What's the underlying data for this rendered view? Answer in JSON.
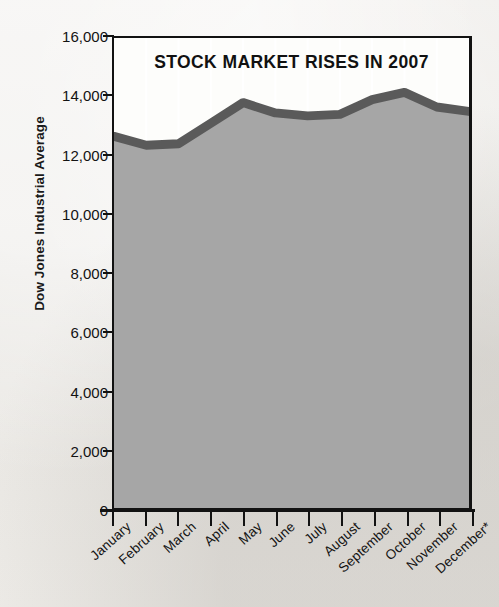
{
  "chart_data": {
    "type": "area",
    "title": "STOCK MARKET RISES IN 2007",
    "xlabel": "",
    "ylabel": "Dow Jones Industrial Average",
    "categories": [
      "January",
      "February",
      "March",
      "April",
      "May",
      "June",
      "July",
      "August",
      "September",
      "October",
      "November",
      "December*"
    ],
    "values": [
      12650,
      12350,
      12400,
      13100,
      13800,
      13450,
      13350,
      13400,
      13900,
      14150,
      13650,
      13500
    ],
    "ylim": [
      0,
      16000
    ],
    "ytick_values": [
      0,
      2000,
      4000,
      6000,
      8000,
      10000,
      12000,
      14000,
      16000
    ],
    "ytick_labels": [
      "0",
      "2,000",
      "4,000",
      "6,000",
      "8,000",
      "10,000",
      "12,000",
      "14,000",
      "16,000"
    ],
    "grid": true,
    "grid_color": "#ffffff",
    "legend": "none",
    "series_name": "Dow Jones Industrial Average",
    "area_fill_color": "#a6a6a6",
    "line_color": "#5a5a5a",
    "axis_color": "#121212",
    "plot_background": "#fdfdfb",
    "page_background": "#eceae6",
    "footnote_marker": "*"
  },
  "figure": {
    "title": "STOCK MARKET RISES IN 2007",
    "y_axis_title": "Dow Jones Industrial Average"
  }
}
